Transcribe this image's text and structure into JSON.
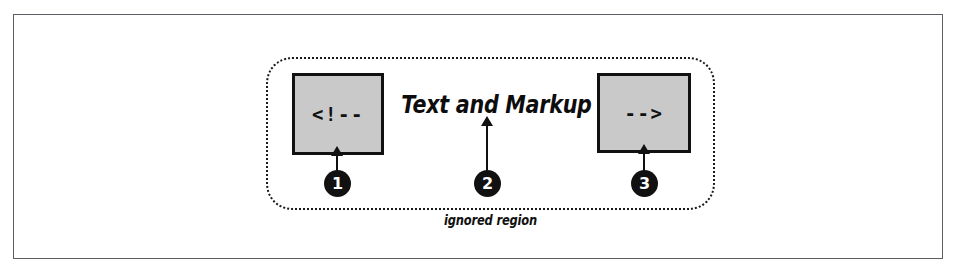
{
  "figure": {
    "title": "Text and Markup",
    "ignored_region_label": "ignored region",
    "colors": {
      "box_fill": "#c9c9c9",
      "ink": "#111111",
      "frame": "#5b5f63",
      "page": "#ffffff"
    }
  },
  "boxes": [
    {
      "id": "open-comment",
      "code": "<!--"
    },
    {
      "id": "close-comment",
      "code": "-->"
    }
  ],
  "callouts": [
    {
      "number": "1",
      "target": "open-comment-box"
    },
    {
      "number": "2",
      "target": "headline-text"
    },
    {
      "number": "3",
      "target": "close-comment-box"
    }
  ]
}
